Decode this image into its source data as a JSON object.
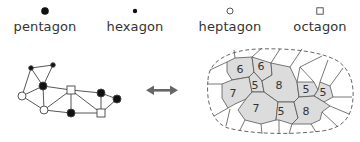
{
  "legend": {
    "items": [
      {
        "label": "pentagon",
        "icon": "filled-circle-large"
      },
      {
        "label": "hexagon",
        "icon": "filled-circle-small"
      },
      {
        "label": "heptagon",
        "icon": "open-circle"
      },
      {
        "label": "octagon",
        "icon": "open-square"
      }
    ]
  },
  "graph": {
    "nodes": [
      {
        "id": "A",
        "type": "hexagon",
        "x": 31,
        "y": 68
      },
      {
        "id": "B",
        "type": "hexagon",
        "x": 53,
        "y": 65
      },
      {
        "id": "C",
        "type": "pentagon",
        "x": 43,
        "y": 86
      },
      {
        "id": "D",
        "type": "heptagon",
        "x": 22,
        "y": 96
      },
      {
        "id": "E",
        "type": "heptagon",
        "x": 44,
        "y": 110
      },
      {
        "id": "F",
        "type": "octagon",
        "x": 71,
        "y": 90
      },
      {
        "id": "G",
        "type": "pentagon",
        "x": 71,
        "y": 113
      },
      {
        "id": "H",
        "type": "pentagon",
        "x": 101,
        "y": 93
      },
      {
        "id": "I",
        "type": "pentagon",
        "x": 117,
        "y": 99
      },
      {
        "id": "J",
        "type": "octagon",
        "x": 101,
        "y": 113
      }
    ],
    "edges": [
      [
        "A",
        "B"
      ],
      [
        "A",
        "C"
      ],
      [
        "B",
        "C"
      ],
      [
        "A",
        "D"
      ],
      [
        "D",
        "C"
      ],
      [
        "D",
        "E"
      ],
      [
        "C",
        "E"
      ],
      [
        "C",
        "F"
      ],
      [
        "E",
        "G"
      ],
      [
        "E",
        "F"
      ],
      [
        "F",
        "G"
      ],
      [
        "F",
        "H"
      ],
      [
        "F",
        "J"
      ],
      [
        "G",
        "J"
      ],
      [
        "H",
        "J"
      ],
      [
        "H",
        "I"
      ],
      [
        "I",
        "J"
      ]
    ]
  },
  "arrow": {
    "icon": "double-arrow",
    "color": "#666666"
  },
  "tessellation": {
    "cells": [
      {
        "label": "6"
      },
      {
        "label": "6"
      },
      {
        "label": "7"
      },
      {
        "label": "5"
      },
      {
        "label": "8"
      },
      {
        "label": "7"
      },
      {
        "label": "5"
      },
      {
        "label": "5"
      },
      {
        "label": "5"
      },
      {
        "label": "8"
      }
    ],
    "fill_color": "#dcdcdc",
    "stroke_color": "#555555"
  }
}
